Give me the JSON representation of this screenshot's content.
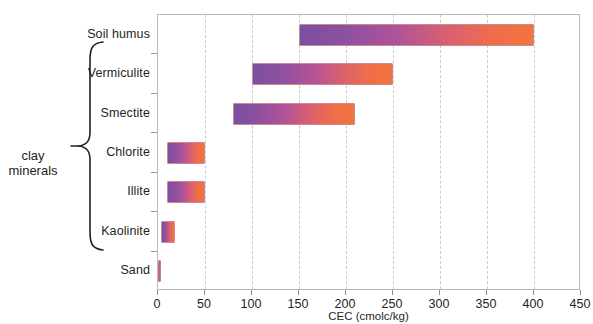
{
  "chart_data": {
    "type": "bar",
    "subtype": "horizontal-range",
    "title": "",
    "xlabel": "CEC (cmolc/kg)",
    "ylabel": "",
    "xlim": [
      0,
      450
    ],
    "xticks": [
      0,
      50,
      100,
      150,
      200,
      250,
      300,
      350,
      400,
      450
    ],
    "xtick_labels": [
      "0",
      "50",
      "100",
      "150",
      "200",
      "250",
      "300",
      "350",
      "400",
      "450"
    ],
    "grid": true,
    "grid_axis": "x",
    "legend": false,
    "categories": [
      "Soil humus",
      "Vermiculite",
      "Smectite",
      "Chlorite",
      "Illite",
      "Kaolinite",
      "Sand"
    ],
    "bars": [
      {
        "category": "Soil humus",
        "start": 150,
        "end": 400
      },
      {
        "category": "Vermiculite",
        "start": 100,
        "end": 250
      },
      {
        "category": "Smectite",
        "start": 80,
        "end": 210
      },
      {
        "category": "Chlorite",
        "start": 10,
        "end": 50
      },
      {
        "category": "Illite",
        "start": 10,
        "end": 50
      },
      {
        "category": "Kaolinite",
        "start": 3,
        "end": 18
      },
      {
        "category": "Sand",
        "start": 0,
        "end": 2
      }
    ],
    "annotations": [
      {
        "text": "clay minerals",
        "type": "brace-group",
        "covers": [
          "Vermiculite",
          "Smectite",
          "Chlorite",
          "Illite",
          "Kaolinite"
        ]
      }
    ],
    "colors": {
      "bar_gradient_start": "#7b4fa0",
      "bar_gradient_end": "#f4733c",
      "bar_border": "#c98a8f",
      "gridline": "#cccccc",
      "axis": "#b9b9b9",
      "text": "#231f20",
      "background": "#ffffff"
    }
  },
  "group_annotation": {
    "line1": "clay",
    "line2": "minerals"
  }
}
